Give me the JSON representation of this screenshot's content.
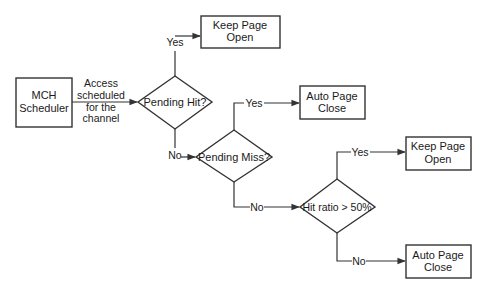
{
  "diagram": {
    "type": "flowchart",
    "nodes": {
      "scheduler": {
        "kind": "process",
        "lines": [
          "MCH",
          "Scheduler"
        ]
      },
      "pending_hit": {
        "kind": "decision",
        "lines": [
          "Pending Hit?"
        ]
      },
      "keep_open_1": {
        "kind": "process",
        "lines": [
          "Keep Page",
          "Open"
        ]
      },
      "pending_miss": {
        "kind": "decision",
        "lines": [
          "Pending Miss?"
        ]
      },
      "auto_close_1": {
        "kind": "process",
        "lines": [
          "Auto Page",
          "Close"
        ]
      },
      "hit_ratio": {
        "kind": "decision",
        "lines": [
          "Hit ratio > 50%"
        ]
      },
      "keep_open_2": {
        "kind": "process",
        "lines": [
          "Keep Page",
          "Open"
        ]
      },
      "auto_close_2": {
        "kind": "process",
        "lines": [
          "Auto Page",
          "Close"
        ]
      }
    },
    "edges": [
      {
        "from": "scheduler",
        "to": "pending_hit",
        "label_lines": [
          "Access",
          "scheduled",
          "for the",
          "channel"
        ]
      },
      {
        "from": "pending_hit",
        "to": "keep_open_1",
        "label": "Yes"
      },
      {
        "from": "pending_hit",
        "to": "pending_miss",
        "label": "No"
      },
      {
        "from": "pending_miss",
        "to": "auto_close_1",
        "label": "Yes"
      },
      {
        "from": "pending_miss",
        "to": "hit_ratio",
        "label": "No"
      },
      {
        "from": "hit_ratio",
        "to": "keep_open_2",
        "label": "Yes"
      },
      {
        "from": "hit_ratio",
        "to": "auto_close_2",
        "label": "No"
      }
    ]
  }
}
